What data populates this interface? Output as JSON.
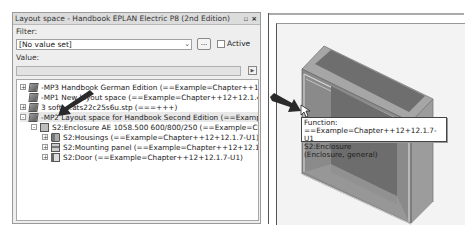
{
  "panel": {
    "title": "Layout space - Handbook EPLAN Electric P8 (2nd Edition)",
    "pin_icon": "pin-icon",
    "close_icon": "close-icon",
    "filter_label": "Filter:",
    "filter_value": "[No value set]",
    "dots_button": "...",
    "active_label": "Active",
    "active_checked": false,
    "value_label": "Value:",
    "value_field": ""
  },
  "tree": {
    "items": [
      {
        "label": "-MP3 Handbook German Edition (==Example=Chapter++12+12.1.7)",
        "expander": "+",
        "icon": "layout-space-icon",
        "indent": 0
      },
      {
        "label": "-MP1 New layout space (==Example=Chapter++12+12.1.4.1)",
        "expander": "",
        "icon": "layout-space-icon",
        "indent": 0
      },
      {
        "label": "3 soft_...ats22c25s6u.stp (===+++)",
        "expander": "+",
        "icon": "layout-space-icon",
        "indent": 0
      },
      {
        "label": "-MP2 Layout space for Handbook Second Edition (==Example=Chapter++",
        "expander": "-",
        "icon": "layout-space-icon",
        "indent": 0,
        "selected": true
      },
      {
        "label": "S2:Enclosure AE 1058.500 600/800/250 (==Example=Chapter++12+",
        "expander": "-",
        "icon": "enclosure-icon",
        "indent": 1
      },
      {
        "label": "S2:Housings (==Example=Chapter++12+12.1.7-U1)",
        "expander": "+",
        "icon": "housing-icon",
        "indent": 2
      },
      {
        "label": "S2:Mounting panel (==Example=Chapter++12+12.1.7-U1)",
        "expander": "+",
        "icon": "mounting-panel-icon",
        "indent": 2
      },
      {
        "label": "S2:Door (==Example=Chapter++12+12.1.7-U1)",
        "expander": "+",
        "icon": "door-icon",
        "indent": 2
      }
    ]
  },
  "viewport": {
    "tooltip": {
      "line1": "Function: ==Example=Chapter++12+12.1.7-U1",
      "line2": "S2:Enclosure",
      "line3": "(Enclosure, general)"
    }
  },
  "colors": {
    "enclosure_front": "#8c8c8c",
    "enclosure_side": "#9e9e9e",
    "enclosure_top": "#a8a8a8",
    "enclosure_inner": "#6f6f6f"
  }
}
